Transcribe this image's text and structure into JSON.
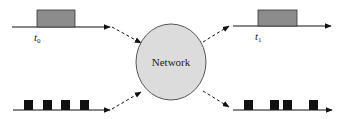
{
  "diagram": {
    "center_node": {
      "label": "Network",
      "fill": "#dcdcdc",
      "stroke": "#555555",
      "cx": 171,
      "cy": 62,
      "rx": 35,
      "ry": 38
    },
    "signals": [
      {
        "id": "input-pulse",
        "position": "top-left",
        "axis": {
          "x1": 12,
          "x2": 110,
          "y": 27
        },
        "pulse": {
          "x": 37,
          "y": 10,
          "width": 38,
          "height": 17,
          "fill": "#8c8c8c"
        },
        "time_label": {
          "base": "t",
          "sub": "0",
          "x": 34,
          "y": 41
        }
      },
      {
        "id": "output-pulse",
        "position": "top-right",
        "axis": {
          "x1": 233,
          "x2": 331,
          "y": 26
        },
        "pulse": {
          "x": 258,
          "y": 10,
          "width": 39,
          "height": 16,
          "fill": "#8c8c8c"
        },
        "time_label": {
          "base": "t",
          "sub": "1",
          "x": 255,
          "y": 40
        }
      },
      {
        "id": "input-packets",
        "position": "bottom-left",
        "axis": {
          "x1": 13,
          "x2": 110,
          "y": 110
        },
        "packets": [
          {
            "x": 24,
            "width": 9,
            "height": 10
          },
          {
            "x": 43,
            "width": 9,
            "height": 10
          },
          {
            "x": 61,
            "width": 9,
            "height": 10
          },
          {
            "x": 80,
            "width": 9,
            "height": 10
          }
        ],
        "packet_fill": "#111111"
      },
      {
        "id": "output-packets",
        "position": "bottom-right",
        "axis": {
          "x1": 233,
          "x2": 332,
          "y": 110
        },
        "packets": [
          {
            "x": 244,
            "width": 9,
            "height": 10
          },
          {
            "x": 270,
            "width": 9,
            "height": 10
          },
          {
            "x": 283,
            "width": 9,
            "height": 10
          },
          {
            "x": 309,
            "width": 9,
            "height": 10
          }
        ],
        "packet_fill": "#111111"
      }
    ],
    "dashed_arrows": [
      {
        "id": "in-top",
        "x1": 112,
        "y1": 27,
        "x2": 141,
        "y2": 43
      },
      {
        "id": "in-bottom",
        "x1": 112,
        "y1": 109,
        "x2": 141,
        "y2": 92
      },
      {
        "id": "out-top",
        "x1": 203,
        "y1": 42,
        "x2": 229,
        "y2": 26
      },
      {
        "id": "out-bottom",
        "x1": 203,
        "y1": 91,
        "x2": 229,
        "y2": 107
      }
    ]
  }
}
